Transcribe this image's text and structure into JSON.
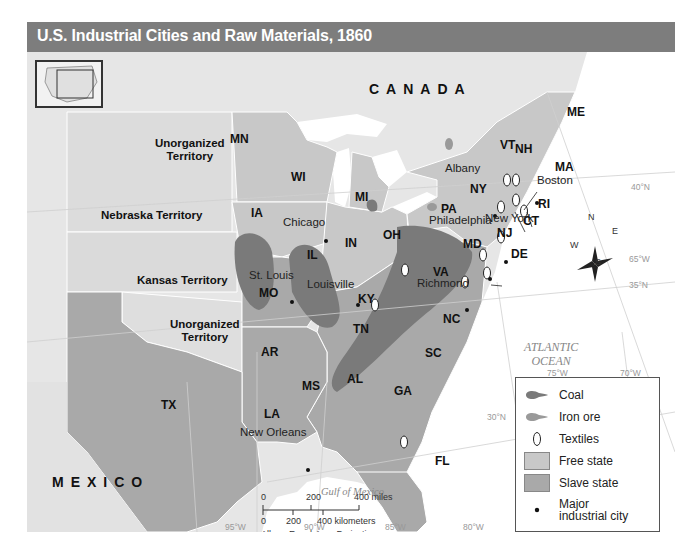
{
  "title": "U.S. Industrial Cities and Raw Materials, 1860",
  "colors": {
    "title_bar": "#7d7d7d",
    "free_state": "#c8c8c8",
    "slave_state": "#a9a9a9",
    "coal": "#7a7a7a",
    "iron_ore": "#9a9a9a",
    "territory": "#dedede",
    "water": "#ffffff"
  },
  "countries": {
    "canada": "CANADA",
    "mexico": "MEXICO"
  },
  "water_bodies": {
    "atlantic_line1": "ATLANTIC",
    "atlantic_line2": "OCEAN",
    "gulf": "Gulf of Mexico"
  },
  "territories": {
    "unorganized_north_1": "Unorganized",
    "unorganized_north_2": "Territory",
    "nebraska": "Nebraska Territory",
    "kansas": "Kansas Territory",
    "unorganized_south_1": "Unorganized",
    "unorganized_south_2": "Territory"
  },
  "states": {
    "ME": "ME",
    "VT": "VT",
    "NH": "NH",
    "MA": "MA",
    "RI": "RI",
    "CT": "CT",
    "NY": "NY",
    "PA": "PA",
    "NJ": "NJ",
    "MD": "MD",
    "DE": "DE",
    "VA": "VA",
    "NC": "NC",
    "SC": "SC",
    "GA": "GA",
    "FL": "FL",
    "AL": "AL",
    "MS": "MS",
    "LA": "LA",
    "TN": "TN",
    "KY": "KY",
    "OH": "OH",
    "IN": "IN",
    "IL": "IL",
    "MI": "MI",
    "WI": "WI",
    "MN": "MN",
    "IA": "IA",
    "MO": "MO",
    "AR": "AR",
    "TX": "TX"
  },
  "cities": {
    "albany": "Albany",
    "boston": "Boston",
    "new_york": "New York",
    "philadelphia": "Philadelphia",
    "richmond": "Richmond",
    "chicago": "Chicago",
    "st_louis": "St. Louis",
    "louisville": "Louisville",
    "new_orleans": "New Orleans"
  },
  "grid_labels": {
    "lat40": "40°N",
    "lat35": "35°N",
    "lat30": "30°N",
    "lon65": "65°W",
    "lon70": "70°W",
    "lon75": "75°W",
    "lon80": "80°W",
    "lon85": "85°W",
    "lon90": "90°W",
    "lon95": "95°W"
  },
  "compass": {
    "n": "N",
    "s": "S",
    "e": "E",
    "w": "W"
  },
  "legend": {
    "items": [
      {
        "label": "Coal",
        "symbol": "coal"
      },
      {
        "label": "Iron ore",
        "symbol": "iron-ore"
      },
      {
        "label": "Textiles",
        "symbol": "textiles"
      },
      {
        "label": "Free state",
        "symbol": "free-state"
      },
      {
        "label": "Slave state",
        "symbol": "slave-state"
      },
      {
        "label": "Major industrial city",
        "label_line1": "Major",
        "label_line2": "industrial city",
        "symbol": "city-dot"
      }
    ]
  },
  "scale_bar": {
    "miles_0": "0",
    "miles_200": "200",
    "miles_400": "400 miles",
    "km_0": "0",
    "km_200": "200",
    "km_400": "400 kilometers",
    "projection": "Albers Equal-Area Projection"
  }
}
